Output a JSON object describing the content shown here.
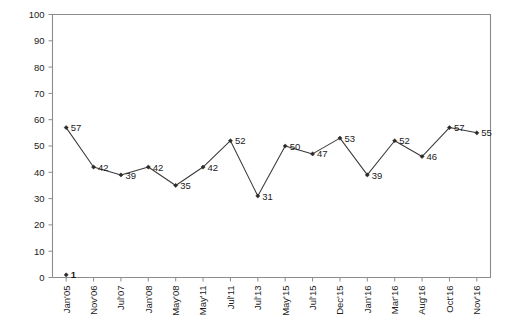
{
  "chart_data": {
    "type": "line",
    "title": "",
    "subtitle": "",
    "xlabel": "",
    "ylabel": "",
    "ylim": [
      0,
      100
    ],
    "ytick_step": 10,
    "yticks": [
      "0",
      "10",
      "20",
      "30",
      "40",
      "50",
      "60",
      "70",
      "80",
      "90",
      "100"
    ],
    "grid": false,
    "legend": "none",
    "categories": [
      "Jan'05",
      "Nov'06",
      "Jul'07",
      "Jan'08",
      "May'08",
      "May'11",
      "Jul'11",
      "Jul'13",
      "May'15",
      "Jul'15",
      "Dec'15",
      "Jan'16",
      "Mar'16",
      "Aug'16",
      "Oct'16",
      "Nov'16"
    ],
    "values": [
      57,
      42,
      39,
      42,
      35,
      42,
      52,
      31,
      50,
      47,
      53,
      39,
      52,
      46,
      57,
      55
    ],
    "data_labels": [
      "57",
      "42",
      "39",
      "42",
      "35",
      "42",
      "52",
      "31",
      "50",
      "47",
      "53",
      "39",
      "52",
      "46",
      "57",
      "55"
    ],
    "series": [
      {
        "name": "Series 1",
        "values": [
          57,
          42,
          39,
          42,
          35,
          42,
          52,
          31,
          50,
          47,
          53,
          39,
          52,
          46,
          57,
          55
        ],
        "color": "#3a3a3a",
        "marker": "diamond"
      }
    ],
    "annotations": [
      {
        "name": "origin-marker",
        "category": "Jan'05",
        "value": 1,
        "label": "1",
        "bold": true
      }
    ],
    "colors": {
      "line": "#3a3a3a",
      "marker": "#2a2a2a",
      "axis": "#8c8c8c",
      "frame": "#8c8c8c",
      "text": "#1a1a1a",
      "background": "#ffffff"
    }
  },
  "axes": {
    "x_label_rotation": "-90"
  }
}
